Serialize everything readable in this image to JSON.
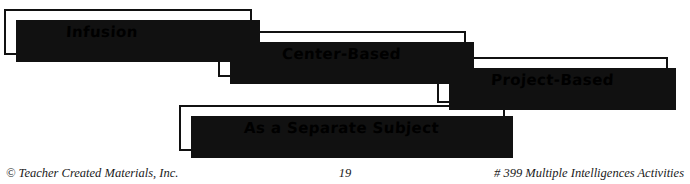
{
  "diagram": {
    "type": "cascading-label-boxes",
    "boxes": [
      {
        "label": "Infusion"
      },
      {
        "label": "Center-Based"
      },
      {
        "label": "Project-Based"
      },
      {
        "label": "As a Separate Subject"
      }
    ]
  },
  "footer": {
    "copyright": "© Teacher Created Materials, Inc.",
    "page_number": "19",
    "source": "# 399 Multiple Intelligences Activities"
  },
  "colors": {
    "ink": "#111111",
    "paper": "#ffffff",
    "footer_text": "#1a1a1a"
  }
}
